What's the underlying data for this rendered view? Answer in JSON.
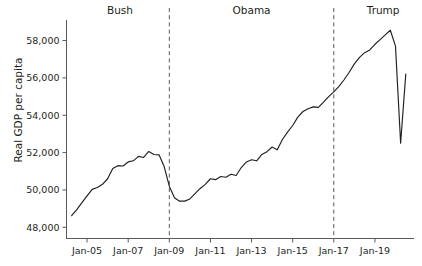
{
  "chart_data": {
    "type": "line",
    "title": "",
    "xlabel": "",
    "ylabel": "Real GDP per capita",
    "ylim": [
      47400,
      59100
    ],
    "xlim": [
      2004.0,
      2020.9
    ],
    "grid": false,
    "legend": "none",
    "y_ticks": [
      48000,
      50000,
      52000,
      54000,
      56000,
      58000
    ],
    "y_tick_labels": [
      "48,000",
      "50,000",
      "52,000",
      "54,000",
      "56,000",
      "58,000"
    ],
    "x_ticks": [
      2005,
      2007,
      2009,
      2011,
      2013,
      2015,
      2017,
      2019
    ],
    "x_tick_labels": [
      "Jan-05",
      "Jan-07",
      "Jan-09",
      "Jan-11",
      "Jan-13",
      "Jan-15",
      "Jan-17",
      "Jan-19"
    ],
    "annotations": [
      {
        "label": "Bush",
        "x": 2006.6,
        "type": "era-label"
      },
      {
        "label": "Obama",
        "x": 2013.0,
        "type": "era-label"
      },
      {
        "label": "Trump",
        "x": 2019.4,
        "type": "era-label"
      }
    ],
    "dividers": [
      {
        "x": 2009.0,
        "label": "Bush to Obama transition"
      },
      {
        "x": 2017.0,
        "label": "Obama to Trump transition"
      }
    ],
    "series": [
      {
        "name": "Real GDP per capita",
        "x": [
          2004.25,
          2004.5,
          2004.75,
          2005.0,
          2005.25,
          2005.5,
          2005.75,
          2006.0,
          2006.25,
          2006.5,
          2006.75,
          2007.0,
          2007.25,
          2007.5,
          2007.75,
          2008.0,
          2008.25,
          2008.5,
          2008.75,
          2009.0,
          2009.25,
          2009.5,
          2009.75,
          2010.0,
          2010.25,
          2010.5,
          2010.75,
          2011.0,
          2011.25,
          2011.5,
          2011.75,
          2012.0,
          2012.25,
          2012.5,
          2012.75,
          2013.0,
          2013.25,
          2013.5,
          2013.75,
          2014.0,
          2014.25,
          2014.5,
          2014.75,
          2015.0,
          2015.25,
          2015.5,
          2015.75,
          2016.0,
          2016.25,
          2016.5,
          2016.75,
          2017.0,
          2017.25,
          2017.5,
          2017.75,
          2018.0,
          2018.25,
          2018.5,
          2018.75,
          2019.0,
          2019.25,
          2019.5,
          2019.75,
          2020.0,
          2020.25,
          2020.5
        ],
        "values": [
          48620,
          48950,
          49320,
          49680,
          50030,
          50130,
          50300,
          50600,
          51150,
          51300,
          51280,
          51500,
          51560,
          51800,
          51740,
          52060,
          51900,
          51880,
          51250,
          50200,
          49580,
          49400,
          49400,
          49520,
          49800,
          50080,
          50300,
          50600,
          50550,
          50720,
          50680,
          50840,
          50770,
          51200,
          51500,
          51620,
          51560,
          51900,
          52050,
          52300,
          52150,
          52700,
          53100,
          53450,
          53900,
          54200,
          54350,
          54450,
          54420,
          54700,
          55000,
          55250,
          55550,
          55900,
          56300,
          56750,
          57100,
          57350,
          57500,
          57800,
          58050,
          58300,
          58550,
          57700,
          52500,
          56200
        ]
      }
    ]
  }
}
